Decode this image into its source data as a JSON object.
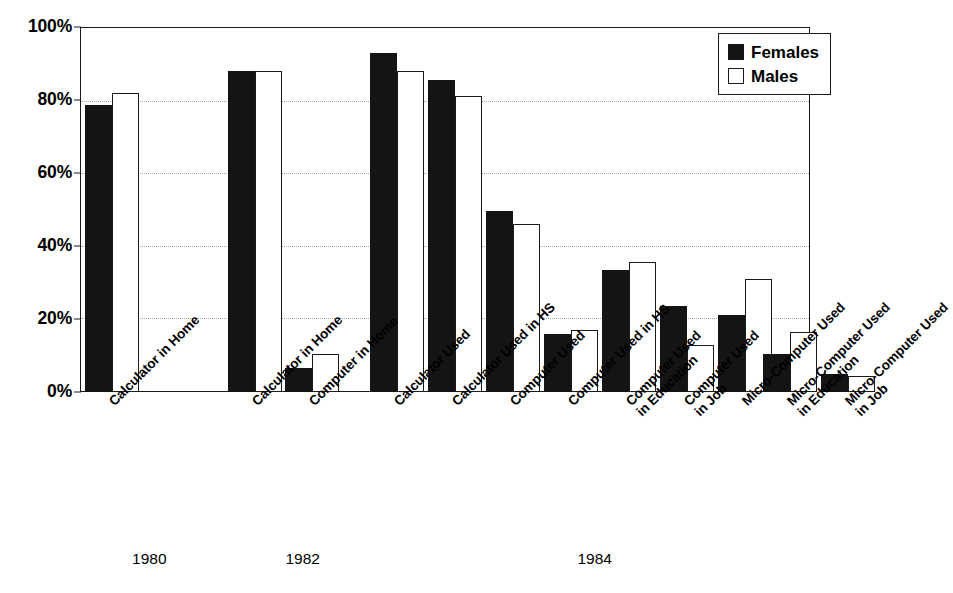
{
  "chart_data": {
    "type": "bar",
    "title": "",
    "subtitle": "",
    "xlabel": "",
    "ylabel": "",
    "ylim": [
      0,
      100
    ],
    "ytick_labels": [
      "0%",
      "20%",
      "40%",
      "60%",
      "80%",
      "100%"
    ],
    "ytick_values": [
      0,
      20,
      40,
      60,
      80,
      100
    ],
    "grid": "horizontal dotted at 20, 40, 60, 80",
    "legend_position": "top-right inside plot",
    "categories": [
      "Calculator in Home",
      "Calculator in Home",
      "Computer in Home",
      "Calculator Used",
      "Calculator Used in HS",
      "Computer Used",
      "Computer Used in HS",
      "Computer Used\nin Education",
      "Computer Used\nin Job",
      "Micro-Computer Used",
      "Micro-Computer Used\nin Education",
      "Micro-Computer Used\nin Job"
    ],
    "series": [
      {
        "name": "Females",
        "color": "#141414",
        "values": [
          78.5,
          88,
          6.5,
          93,
          85.5,
          49.5,
          16,
          33.5,
          23.5,
          21,
          10.5,
          5
        ]
      },
      {
        "name": "Males",
        "color": "#ffffff",
        "values": [
          82,
          88,
          10.5,
          88,
          81,
          46,
          17,
          35.5,
          13,
          31,
          16.5,
          4.5
        ]
      }
    ],
    "group_annotations": [
      {
        "label": "1980",
        "x_center_pct": 9.5
      },
      {
        "label": "1982",
        "x_center_pct": 30.5
      },
      {
        "label": "1984",
        "x_center_pct": 70.5
      }
    ]
  },
  "legend": {
    "entries": [
      {
        "label": "Females",
        "swatch": "filled-black-square"
      },
      {
        "label": "Males",
        "swatch": "outlined-white-square"
      }
    ]
  }
}
